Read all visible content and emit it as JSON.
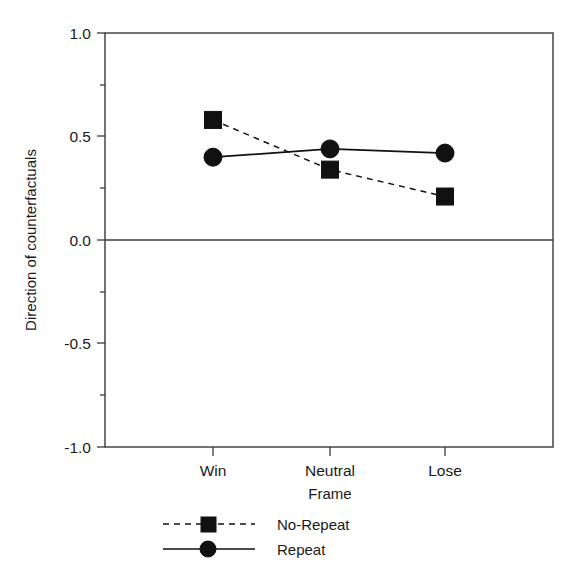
{
  "chart_data": {
    "type": "line",
    "title": "",
    "xlabel": "Frame",
    "ylabel": "Direction of counterfactuals",
    "categories": [
      "Win",
      "Neutral",
      "Lose"
    ],
    "ylim": [
      -1.0,
      1.0
    ],
    "ytick_labels": [
      "1.0",
      "0.5",
      "0.0",
      "-0.5",
      "-1.0"
    ],
    "ytick_values": [
      1.0,
      0.5,
      0.0,
      -0.5,
      -1.0
    ],
    "minor_tick_values": [
      0.75,
      0.25,
      -0.25,
      -0.75
    ],
    "grid": false,
    "zero_line": true,
    "legend_position": "below",
    "series": [
      {
        "name": "No-Repeat",
        "marker": "square",
        "line_style": "dashed",
        "color": "#111111",
        "values": [
          0.58,
          0.34,
          0.21
        ]
      },
      {
        "name": "Repeat",
        "marker": "circle",
        "line_style": "solid",
        "color": "#111111",
        "values": [
          0.4,
          0.44,
          0.42
        ]
      }
    ]
  },
  "axes": {
    "y_label": "Direction of counterfactuals",
    "x_label": "Frame",
    "y_ticks": [
      {
        "label": "1.0"
      },
      {
        "label": "0.5"
      },
      {
        "label": "0.0"
      },
      {
        "label": "-0.5"
      },
      {
        "label": "-1.0"
      }
    ],
    "x_ticks": [
      {
        "label": "Win"
      },
      {
        "label": "Neutral"
      },
      {
        "label": "Lose"
      }
    ]
  },
  "legend": {
    "entries": [
      {
        "label": "No-Repeat"
      },
      {
        "label": "Repeat"
      }
    ]
  }
}
